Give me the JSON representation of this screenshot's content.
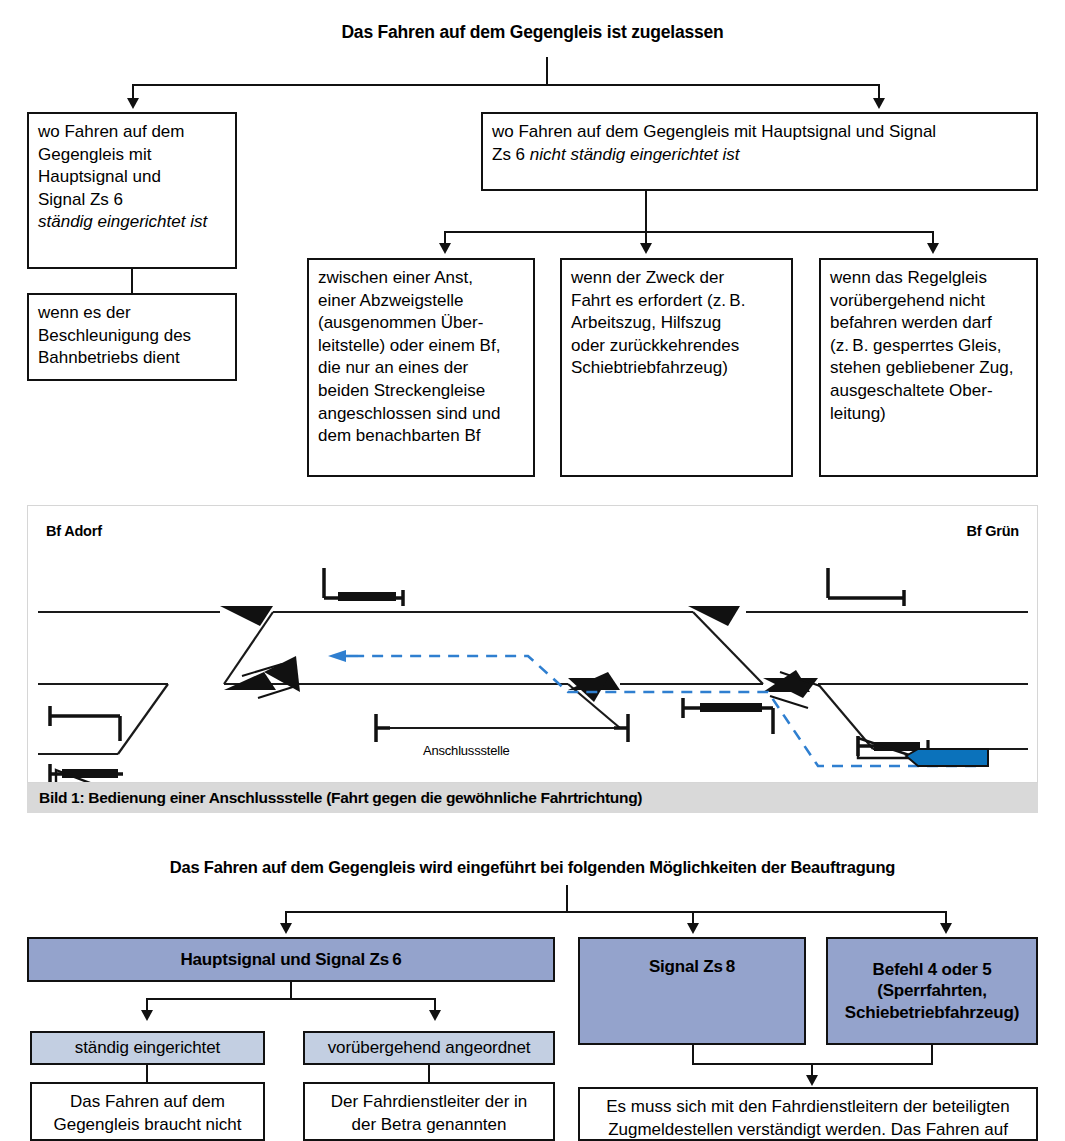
{
  "top_chart": {
    "title": "Das Fahren auf dem Gegengleis ist zugelassen",
    "left_box": {
      "line1": "wo Fahren auf dem",
      "line2": "Gegengleis mit",
      "line3": "Hauptsignal und",
      "line4": "Signal Zs 6",
      "line5_italic": "ständig eingerichtet ist"
    },
    "left_child": {
      "line1": "wenn es der",
      "line2": "Beschleunigung des",
      "line3": "Bahnbetriebs dient"
    },
    "right_box": {
      "line1": "wo Fahren auf dem Gegengleis mit Hauptsignal und Signal",
      "line2_pre": "Zs 6 ",
      "line2_italic": "nicht ständig eingerichtet ist"
    },
    "children": [
      {
        "text": "zwischen einer Anst, einer Abzweigstelle (ausgenommen Über-leitstelle) oder einem Bf, die nur an eines der beiden Streckengleise angeschlossen sind und dem benachbarten Bf",
        "lines": [
          "zwischen einer Anst,",
          "einer Abzweigstelle",
          "(ausgenommen Über-",
          "leitstelle) oder einem Bf,",
          "die nur an eines der",
          "beiden Streckengleise",
          "angeschlossen sind und",
          "dem benachbarten Bf"
        ]
      },
      {
        "text": "wenn der Zweck der Fahrt es erfordert (z.B. Arbeitszug, Hilfszug oder zurückkehrendes Schiebtriebfahrzeug)",
        "lines": [
          "wenn der Zweck der",
          "Fahrt es erfordert (z. B.",
          "Arbeitszug, Hilfszug",
          "oder zurückkehrendes",
          "Schiebtriebfahrzeug)"
        ]
      },
      {
        "text": "wenn das Regelgleis vorübergehend nicht befahren werden darf (z.B. gesperrtes Gleis, stehen gebliebener Zug, ausgeschaltete Oberleitung)",
        "lines": [
          "wenn das Regelgleis",
          "vorübergehend nicht",
          "befahren werden darf",
          "(z. B. gesperrtes Gleis,",
          "stehen gebliebener Zug,",
          "ausgeschaltete Ober-",
          "leitung)"
        ]
      }
    ]
  },
  "figure": {
    "caption": "Bild 1:  Bedienung einer Anschlussstelle (Fahrt gegen die gewöhnliche Fahrtrichtung)",
    "station_left": "Bf Adorf",
    "station_right": "Bf Grün",
    "anschlussstelle_label": "Anschlussstelle",
    "route_color": "#2f7fd0",
    "train_color": "#0b72bb"
  },
  "bottom_chart": {
    "title": "Das Fahren auf dem Gegengleis wird eingeführt bei folgenden Möglichkeiten der Beauftragung",
    "blue_color": "#94a3cc",
    "lightblue_color": "#c3cfe2",
    "boxes": {
      "hauptsignal": "Hauptsignal und Signal Zs 6",
      "signal_zs8": "Signal Zs 8",
      "befehl_line1": "Befehl 4 oder 5",
      "befehl_line2": "(Sperrfahrten,",
      "befehl_line3": "Schiebetriebfahrzeug)",
      "staendig": "ständig eingerichtet",
      "voruebergehend": "vorübergehend angeordnet"
    },
    "leaf_left": {
      "line1": "Das Fahren auf dem",
      "line2": "Gegengleis braucht nicht"
    },
    "leaf_mid": {
      "line1": "Der Fahrdienstleiter der in",
      "line2": "der Betra genannten"
    },
    "leaf_right": {
      "line1": "Es muss sich mit den Fahrdienstleitern der beteiligten",
      "line2": "Zugmeldestellen verständigt werden. Das Fahren auf"
    }
  }
}
